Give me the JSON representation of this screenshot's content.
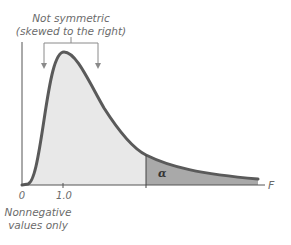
{
  "annotation_top": {
    "line1": "Not symmetric",
    "line2": "(skewed to the right)"
  },
  "annotation_bottom": {
    "line1": "Nonnegative",
    "line2": "values only"
  },
  "axis": {
    "origin_label": "0",
    "tick_label": "1.0",
    "x_label": "F"
  },
  "region": {
    "alpha_label": "α"
  },
  "colors": {
    "curve": "#5a5a5a",
    "body_fill": "#e8e8e8",
    "tail_fill": "#a9a9a9",
    "annotation": "#7a7a7a"
  }
}
